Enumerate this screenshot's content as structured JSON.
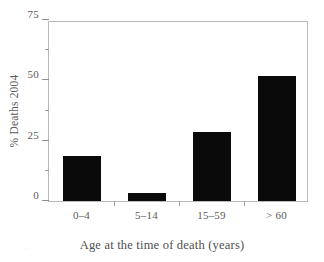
{
  "chart_data": {
    "type": "bar",
    "title": "",
    "subtitle": "",
    "xlabel": "Age at the time of death (years)",
    "ylabel": "% Deaths 2004",
    "categories": [
      "0–4",
      "5–14",
      "15–59",
      "> 60"
    ],
    "values": [
      18.5,
      3.3,
      28.5,
      52
    ],
    "series": [
      {
        "name": "% Deaths 2004",
        "values": [
          18.5,
          3.3,
          28.5,
          52
        ]
      }
    ],
    "ylim": [
      0,
      75
    ],
    "y_ticks": [
      0,
      25,
      50,
      75
    ],
    "y_tick_labels": [
      "0",
      "25",
      "50",
      "75"
    ],
    "y_minor_ticks": [
      12.5,
      37.5,
      62.5
    ],
    "grid": false,
    "legend": "none",
    "bar_color": "#0a0a0a",
    "frame_color": "#b9b9b9",
    "text_color": "#5a5a5a"
  },
  "axes": {
    "y_title": "% Deaths 2004",
    "x_title": "Age at the time of death (years)"
  },
  "artifact": {
    "mark": "·"
  }
}
